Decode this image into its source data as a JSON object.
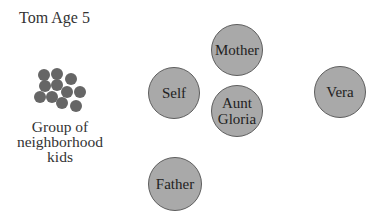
{
  "title": "Tom Age 5",
  "group": {
    "caption_lines": [
      "Group of",
      "neighborhood",
      "kids"
    ],
    "dot_color": "#666666",
    "dots": [
      {
        "x": 44,
        "y": 75
      },
      {
        "x": 57,
        "y": 74
      },
      {
        "x": 71,
        "y": 79
      },
      {
        "x": 45,
        "y": 86
      },
      {
        "x": 57,
        "y": 85
      },
      {
        "x": 67,
        "y": 92
      },
      {
        "x": 80,
        "y": 92
      },
      {
        "x": 40,
        "y": 97
      },
      {
        "x": 52,
        "y": 97
      },
      {
        "x": 62,
        "y": 103
      },
      {
        "x": 76,
        "y": 106
      }
    ]
  },
  "nodes": [
    {
      "id": "mother",
      "lines": [
        "Mother"
      ],
      "cx": 237,
      "cy": 50,
      "r": 26
    },
    {
      "id": "self",
      "lines": [
        "Self"
      ],
      "cx": 174,
      "cy": 93,
      "r": 26
    },
    {
      "id": "aunt-gloria",
      "lines": [
        "Aunt",
        "Gloria"
      ],
      "cx": 237,
      "cy": 111,
      "r": 26
    },
    {
      "id": "vera",
      "lines": [
        "Vera"
      ],
      "cx": 340,
      "cy": 92,
      "r": 26
    },
    {
      "id": "father",
      "lines": [
        "Father"
      ],
      "cx": 175,
      "cy": 184,
      "r": 27
    }
  ],
  "colors": {
    "node_fill": "#a9a9a9",
    "node_stroke": "#5e5e5e",
    "text": "#222222"
  }
}
